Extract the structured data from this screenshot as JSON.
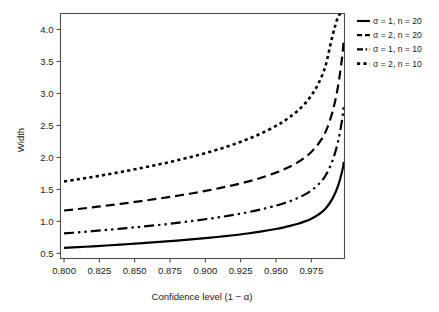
{
  "chart_data": {
    "type": "line",
    "title": "",
    "xlabel": "Confidence level (1 − α)",
    "ylabel": "Width",
    "xlim": [
      0.7975,
      0.9985
    ],
    "ylim": [
      0.42,
      4.25
    ],
    "xticks": [
      0.8,
      0.825,
      0.85,
      0.875,
      0.9,
      0.925,
      0.95,
      0.975
    ],
    "xticklabels": [
      "0.800",
      "0.825",
      "0.850",
      "0.875",
      "0.900",
      "0.925",
      "0.950",
      "0.975"
    ],
    "yticks": [
      0.5,
      1.0,
      1.5,
      2.0,
      2.5,
      3.0,
      3.5,
      4.0
    ],
    "yticklabels": [
      "0.5",
      "1.0",
      "1.5",
      "2.0",
      "2.5",
      "3.0",
      "3.5",
      "4.0"
    ],
    "grid": false,
    "legend_position": "right-outside",
    "x": [
      0.8,
      0.81,
      0.82,
      0.83,
      0.84,
      0.85,
      0.86,
      0.87,
      0.88,
      0.89,
      0.9,
      0.91,
      0.92,
      0.93,
      0.94,
      0.95,
      0.955,
      0.96,
      0.965,
      0.97,
      0.975,
      0.98,
      0.985,
      0.99,
      0.994,
      0.997,
      0.998
    ],
    "series": [
      {
        "name": "σ = 1, n = 20",
        "sigma": 1,
        "n": 20,
        "dash": "solid",
        "width": 2.2,
        "values": [
          0.585,
          0.597,
          0.61,
          0.623,
          0.637,
          0.652,
          0.667,
          0.683,
          0.7,
          0.718,
          0.738,
          0.76,
          0.784,
          0.811,
          0.843,
          0.881,
          0.903,
          0.929,
          0.959,
          0.996,
          1.043,
          1.106,
          1.198,
          1.356,
          1.56,
          1.8,
          1.93
        ]
      },
      {
        "name": "σ = 2, n = 20",
        "sigma": 2,
        "n": 20,
        "dash": "dashed",
        "width": 2.2,
        "values": [
          1.17,
          1.194,
          1.22,
          1.246,
          1.274,
          1.304,
          1.334,
          1.366,
          1.4,
          1.436,
          1.476,
          1.52,
          1.568,
          1.622,
          1.686,
          1.762,
          1.806,
          1.858,
          1.918,
          1.992,
          2.086,
          2.212,
          2.396,
          2.712,
          3.12,
          3.6,
          3.86
        ]
      },
      {
        "name": "σ = 1, n = 10",
        "sigma": 1,
        "n": 10,
        "dash": "dashdot",
        "width": 2.2,
        "values": [
          0.812,
          0.829,
          0.847,
          0.866,
          0.886,
          0.907,
          0.929,
          0.952,
          0.977,
          1.004,
          1.034,
          1.066,
          1.102,
          1.143,
          1.19,
          1.246,
          1.279,
          1.317,
          1.361,
          1.415,
          1.484,
          1.577,
          1.714,
          1.95,
          2.255,
          2.62,
          2.83
        ]
      },
      {
        "name": "σ = 2, n = 10",
        "sigma": 2,
        "n": 10,
        "dash": "dotted",
        "width": 2.6,
        "values": [
          1.624,
          1.658,
          1.694,
          1.732,
          1.772,
          1.814,
          1.858,
          1.904,
          1.954,
          2.008,
          2.068,
          2.132,
          2.204,
          2.286,
          2.38,
          2.492,
          2.558,
          2.634,
          2.722,
          2.83,
          2.968,
          3.154,
          3.428,
          3.9,
          4.2,
          4.25,
          4.25
        ]
      }
    ]
  },
  "legend": {
    "items": [
      {
        "label": "σ = 1, n = 20"
      },
      {
        "label": "σ = 2, n = 20"
      },
      {
        "label": "σ = 1, n = 10"
      },
      {
        "label": "σ = 2, n = 10"
      }
    ]
  },
  "axes": {
    "xlabel": "Confidence level (1 − α)",
    "ylabel": "Width"
  },
  "colors": {
    "line": "#000000",
    "frame": "#4d4d4d",
    "background": "#ffffff",
    "text": "#1a1a1a"
  }
}
